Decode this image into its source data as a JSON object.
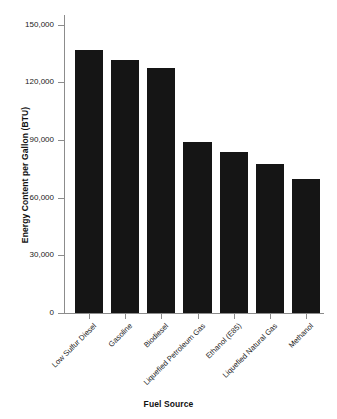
{
  "chart_data": {
    "type": "bar",
    "title": "",
    "xlabel": "Fuel Source",
    "ylabel": "Energy Content per Gallon (BTU)",
    "categories": [
      "Low Sulfur Diesel",
      "Gasoline",
      "Biodiesel",
      "Liquefied Petroleum Gas",
      "Ethanol (E85)",
      "Liquefied Natural Gas",
      "Methanol"
    ],
    "values": [
      137000,
      131500,
      127500,
      89000,
      84000,
      77500,
      69500
    ],
    "ylim": [
      0,
      155000
    ],
    "yticks": [
      0,
      30000,
      60000,
      90000,
      120000,
      150000
    ],
    "ytick_labels": [
      "0",
      "30,000",
      "60,000",
      "90,000",
      "120,000",
      "150,000"
    ],
    "grid": false,
    "legend": "none",
    "bar_color": "#151515",
    "axis_color": "#8c8c8c",
    "background_color": "#ffffff"
  }
}
